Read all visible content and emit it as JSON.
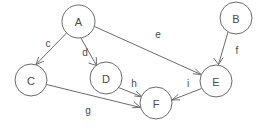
{
  "diagram": {
    "type": "directed-graph",
    "background_color": "#ffffff",
    "stroke_color": "#6b6b6b",
    "text_color": "#4a4a4a",
    "width": 272,
    "height": 129,
    "nodes": [
      {
        "id": "A",
        "label": "A",
        "cx": 78.5,
        "cy": 21.5,
        "r": 16.5
      },
      {
        "id": "B",
        "label": "B",
        "cx": 236.0,
        "cy": 18.0,
        "r": 16.0
      },
      {
        "id": "C",
        "label": "C",
        "cx": 31.0,
        "cy": 80.0,
        "r": 16.0
      },
      {
        "id": "D",
        "label": "D",
        "cx": 106.0,
        "cy": 78.0,
        "r": 16.0
      },
      {
        "id": "E",
        "label": "E",
        "cx": 216.0,
        "cy": 81.0,
        "r": 16.0
      },
      {
        "id": "F",
        "label": "F",
        "cx": 156.0,
        "cy": 103.0,
        "r": 16.0
      }
    ],
    "edges": [
      {
        "id": "c",
        "label": "c",
        "from": "A",
        "to": "C",
        "label_x": 48,
        "label_y": 43
      },
      {
        "id": "d",
        "label": "d",
        "from": "A",
        "to": "D",
        "label_x": 85,
        "label_y": 52
      },
      {
        "id": "e",
        "label": "e",
        "from": "A",
        "to": "E",
        "label_x": 158,
        "label_y": 34
      },
      {
        "id": "f",
        "label": "f",
        "from": "B",
        "to": "E",
        "label_x": 237,
        "label_y": 50
      },
      {
        "id": "g",
        "label": "g",
        "from": "C",
        "to": "F",
        "label_x": 88,
        "label_y": 110
      },
      {
        "id": "h",
        "label": "h",
        "from": "D",
        "to": "F",
        "label_x": 134,
        "label_y": 83
      },
      {
        "id": "i",
        "label": "i",
        "from": "E",
        "to": "F",
        "label_x": 188,
        "label_y": 83
      }
    ]
  }
}
